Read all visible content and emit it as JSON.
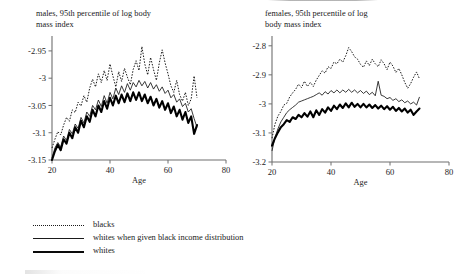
{
  "figure": {
    "background": "#ffffff",
    "ink_color": "#111111"
  },
  "panels": [
    {
      "id": "males",
      "title": "males, 95th percentile of log body\nmass index",
      "xlabel": "Age",
      "xticks": [
        "20",
        "40",
        "60",
        "80"
      ],
      "yticks": [
        "-2.95",
        "-3",
        "-3.05",
        "-3.1",
        "-3.15"
      ]
    },
    {
      "id": "females",
      "title": "females, 95th percentile of log\nbody mass index",
      "xlabel": "Age",
      "xticks": [
        "20",
        "40",
        "60",
        "80"
      ],
      "yticks": [
        "-2.8",
        "-2.9",
        "-3",
        "-3.1",
        "-3.2"
      ]
    }
  ],
  "legend": {
    "items": [
      {
        "label": "blacks",
        "style": "dotted"
      },
      {
        "label": "whites when given black income distribution",
        "style": "thin-solid"
      },
      {
        "label": "whites",
        "style": "thick-solid"
      }
    ]
  },
  "chart_data": [
    {
      "type": "line",
      "title": "males, 95th percentile of log body mass index",
      "xlabel": "Age",
      "ylabel": "",
      "xlim": [
        20,
        80
      ],
      "ylim": [
        -3.15,
        -2.93
      ],
      "xticks": [
        20,
        40,
        60,
        80
      ],
      "yticks": [
        -2.95,
        -3,
        -3.05,
        -3.1,
        -3.15
      ],
      "grid": false,
      "legend_position": "below-figure",
      "x": [
        20,
        21,
        22,
        23,
        24,
        25,
        26,
        27,
        28,
        29,
        30,
        31,
        32,
        33,
        34,
        35,
        36,
        37,
        38,
        39,
        40,
        41,
        42,
        43,
        44,
        45,
        46,
        47,
        48,
        49,
        50,
        51,
        52,
        53,
        54,
        55,
        56,
        57,
        58,
        59,
        60,
        61,
        62,
        63,
        64,
        65,
        66,
        67,
        68,
        69,
        70
      ],
      "series": [
        {
          "name": "blacks",
          "values": [
            -3.128,
            -3.112,
            -3.098,
            -3.104,
            -3.086,
            -3.072,
            -3.079,
            -3.058,
            -3.063,
            -3.044,
            -3.051,
            -3.032,
            -3.044,
            -3.018,
            -3.002,
            -3.016,
            -2.992,
            -3.008,
            -2.986,
            -3.004,
            -2.974,
            -2.996,
            -3.016,
            -2.988,
            -3.006,
            -2.982,
            -2.998,
            -3.012,
            -2.984,
            -2.968,
            -2.986,
            -2.942,
            -2.974,
            -2.994,
            -2.962,
            -2.984,
            -3.004,
            -2.972,
            -2.948,
            -2.972,
            -2.992,
            -3.014,
            -3.026,
            -3.004,
            -3.03,
            -3.042,
            -3.026,
            -3.05,
            -3.038,
            -2.996,
            -3.036
          ]
        },
        {
          "name": "whites when given black income distribution",
          "values": [
            -3.146,
            -3.128,
            -3.118,
            -3.126,
            -3.106,
            -3.114,
            -3.094,
            -3.102,
            -3.084,
            -3.092,
            -3.072,
            -3.082,
            -3.062,
            -3.07,
            -3.05,
            -3.058,
            -3.04,
            -3.052,
            -3.032,
            -3.046,
            -3.026,
            -3.038,
            -3.018,
            -3.03,
            -3.014,
            -3.026,
            -3.01,
            -3.022,
            -3.008,
            -3.016,
            -3.004,
            -3.014,
            -3.006,
            -3.018,
            -3.008,
            -3.02,
            -3.012,
            -3.024,
            -3.016,
            -3.028,
            -3.022,
            -3.036,
            -3.03,
            -3.044,
            -3.038,
            -3.052,
            -3.046,
            -3.062,
            -3.056,
            -3.074,
            -3.09
          ]
        },
        {
          "name": "whites",
          "values": [
            -3.15,
            -3.134,
            -3.122,
            -3.132,
            -3.112,
            -3.12,
            -3.1,
            -3.11,
            -3.09,
            -3.1,
            -3.078,
            -3.09,
            -3.07,
            -3.08,
            -3.058,
            -3.07,
            -3.05,
            -3.062,
            -3.042,
            -3.056,
            -3.036,
            -3.05,
            -3.032,
            -3.046,
            -3.03,
            -3.044,
            -3.028,
            -3.042,
            -3.026,
            -3.04,
            -3.026,
            -3.042,
            -3.03,
            -3.046,
            -3.034,
            -3.05,
            -3.038,
            -3.054,
            -3.042,
            -3.058,
            -3.046,
            -3.064,
            -3.052,
            -3.07,
            -3.058,
            -3.076,
            -3.062,
            -3.082,
            -3.07,
            -3.102,
            -3.086
          ]
        }
      ]
    },
    {
      "type": "line",
      "title": "females, 95th percentile of log body mass index",
      "xlabel": "Age",
      "ylabel": "",
      "xlim": [
        20,
        80
      ],
      "ylim": [
        -3.2,
        -2.78
      ],
      "xticks": [
        20,
        40,
        60,
        80
      ],
      "yticks": [
        -2.8,
        -2.9,
        -3,
        -3.1,
        -3.2
      ],
      "grid": false,
      "legend_position": "below-figure",
      "x": [
        20,
        21,
        22,
        23,
        24,
        25,
        26,
        27,
        28,
        29,
        30,
        31,
        32,
        33,
        34,
        35,
        36,
        37,
        38,
        39,
        40,
        41,
        42,
        43,
        44,
        45,
        46,
        47,
        48,
        49,
        50,
        51,
        52,
        53,
        54,
        55,
        56,
        57,
        58,
        59,
        60,
        61,
        62,
        63,
        64,
        65,
        66,
        67,
        68,
        69,
        70
      ],
      "series": [
        {
          "name": "blacks",
          "values": [
            -3.118,
            -3.07,
            -3.042,
            -3.026,
            -3.004,
            -2.998,
            -2.976,
            -2.962,
            -2.95,
            -2.932,
            -2.944,
            -2.922,
            -2.94,
            -2.926,
            -2.94,
            -2.918,
            -2.902,
            -2.886,
            -2.894,
            -2.872,
            -2.878,
            -2.856,
            -2.862,
            -2.846,
            -2.856,
            -2.834,
            -2.806,
            -2.82,
            -2.838,
            -2.846,
            -2.864,
            -2.874,
            -2.852,
            -2.868,
            -2.846,
            -2.862,
            -2.872,
            -2.848,
            -2.862,
            -2.882,
            -2.856,
            -2.87,
            -2.892,
            -2.878,
            -2.9,
            -2.926,
            -2.946,
            -2.93,
            -2.908,
            -2.89,
            -2.914
          ]
        },
        {
          "name": "whites when given black income distribution",
          "values": [
            -3.162,
            -3.116,
            -3.086,
            -3.062,
            -3.046,
            -3.03,
            -3.02,
            -3.012,
            -3.004,
            -2.994,
            -2.99,
            -2.986,
            -2.982,
            -2.978,
            -2.974,
            -2.968,
            -2.962,
            -2.97,
            -2.958,
            -2.966,
            -2.954,
            -2.962,
            -2.952,
            -2.962,
            -2.952,
            -2.96,
            -2.95,
            -2.96,
            -2.952,
            -2.962,
            -2.954,
            -2.964,
            -2.956,
            -2.968,
            -2.96,
            -2.972,
            -2.922,
            -2.97,
            -2.974,
            -2.982,
            -2.978,
            -2.988,
            -2.982,
            -2.992,
            -2.986,
            -2.996,
            -2.99,
            -3.0,
            -2.994,
            -3.004,
            -2.976
          ]
        },
        {
          "name": "whites",
          "values": [
            -3.144,
            -3.118,
            -3.098,
            -3.08,
            -3.07,
            -3.056,
            -3.062,
            -3.046,
            -3.052,
            -3.038,
            -3.046,
            -3.032,
            -3.044,
            -3.026,
            -3.046,
            -3.022,
            -3.038,
            -3.018,
            -3.03,
            -3.012,
            -3.024,
            -3.006,
            -3.018,
            -3.002,
            -3.014,
            -2.998,
            -3.012,
            -2.996,
            -3.01,
            -3.0,
            -3.012,
            -3.0,
            -3.012,
            -3.002,
            -3.014,
            -3.004,
            -3.016,
            -3.006,
            -3.018,
            -3.008,
            -3.02,
            -3.01,
            -3.024,
            -3.014,
            -3.026,
            -3.016,
            -3.03,
            -3.02,
            -3.038,
            -3.026,
            -3.016
          ]
        }
      ]
    }
  ]
}
